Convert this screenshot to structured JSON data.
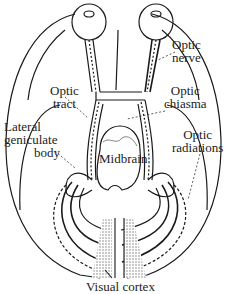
{
  "diagram": {
    "type": "visual-pathway",
    "labels": {
      "optic_nerve": [
        "Optic",
        "nerve"
      ],
      "optic_tract": [
        "Optic",
        "tract"
      ],
      "optic_chiasma": [
        "Optic",
        "chiasma"
      ],
      "lateral_geniculate_body": [
        "Lateral",
        "geniculate",
        "body"
      ],
      "optic_radiations": [
        "Optic",
        "radiations"
      ],
      "midbrain": "Midbrain",
      "visual_cortex": "Visual cortex"
    },
    "colors": {
      "line": "#1a1a1a",
      "shading": "#bdbdbd",
      "background": "#ffffff"
    }
  }
}
